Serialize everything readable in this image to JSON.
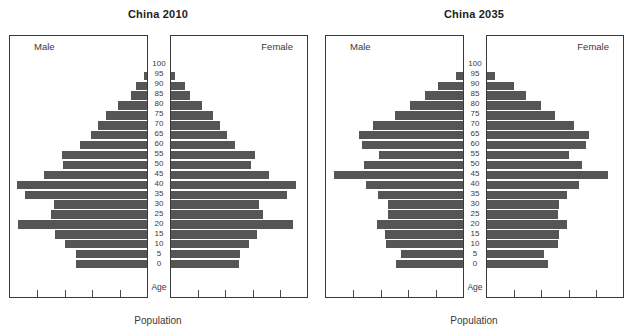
{
  "figure": {
    "axis_title": "Population",
    "age_caption": "Age",
    "male_label": "Male",
    "female_label": "Female",
    "bar_color": "#555555",
    "frame_color": "#3a3a3a",
    "background": "#ffffff",
    "bottom_ticks": 4
  },
  "chart_data": [
    {
      "type": "bar",
      "title": "China 2010",
      "subtype": "population-pyramid",
      "xlabel": "Population",
      "ylabel": "Age",
      "grid": false,
      "legend": "none",
      "categories": [
        "0",
        "5",
        "10",
        "15",
        "20",
        "25",
        "30",
        "35",
        "40",
        "45",
        "50",
        "55",
        "60",
        "65",
        "70",
        "75",
        "80",
        "85",
        "90",
        "95",
        "100"
      ],
      "axis_ranges": {
        "male_x": [
          0,
          100
        ],
        "female_x": [
          0,
          100
        ]
      },
      "series": [
        {
          "name": "Male",
          "direction": "left",
          "values": [
            52,
            52,
            60,
            67,
            94,
            70,
            68,
            89,
            95,
            75,
            61,
            62,
            49,
            41,
            36,
            30,
            21,
            12,
            8,
            2,
            0
          ]
        },
        {
          "name": "Female",
          "direction": "right",
          "values": [
            50,
            51,
            57,
            63,
            90,
            68,
            65,
            85,
            92,
            72,
            59,
            62,
            47,
            41,
            36,
            31,
            23,
            14,
            10,
            3,
            0
          ]
        }
      ]
    },
    {
      "type": "bar",
      "title": "China 2035",
      "subtype": "population-pyramid",
      "xlabel": "Population",
      "ylabel": "Age",
      "grid": false,
      "legend": "none",
      "categories": [
        "0",
        "5",
        "10",
        "15",
        "20",
        "25",
        "30",
        "35",
        "40",
        "45",
        "50",
        "55",
        "60",
        "65",
        "70",
        "75",
        "80",
        "85",
        "90",
        "95",
        "100"
      ],
      "axis_ranges": {
        "male_x": [
          0,
          100
        ],
        "female_x": [
          0,
          100
        ]
      },
      "series": [
        {
          "name": "Male",
          "direction": "left",
          "values": [
            49,
            45,
            56,
            57,
            63,
            55,
            55,
            62,
            71,
            94,
            72,
            61,
            74,
            76,
            66,
            50,
            39,
            28,
            18,
            5,
            0
          ]
        },
        {
          "name": "Female",
          "direction": "right",
          "values": [
            45,
            42,
            52,
            53,
            59,
            52,
            53,
            59,
            68,
            89,
            70,
            60,
            73,
            75,
            64,
            50,
            40,
            29,
            20,
            6,
            0
          ]
        }
      ]
    }
  ]
}
